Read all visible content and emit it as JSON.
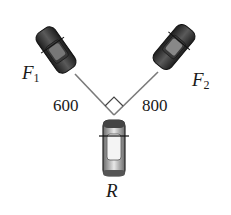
{
  "diagram": {
    "labels": {
      "car_left": "F",
      "car_left_sub": "1",
      "car_right": "F",
      "car_right_sub": "2",
      "car_bottom": "R",
      "rope_left_value": "600",
      "rope_right_value": "800"
    },
    "colors": {
      "rope": "#7a7a7a",
      "car_dark": "#2b2b2b",
      "car_light": "#bdbdbd",
      "text": "#1a1a1a"
    },
    "right_angle_marker": true
  }
}
